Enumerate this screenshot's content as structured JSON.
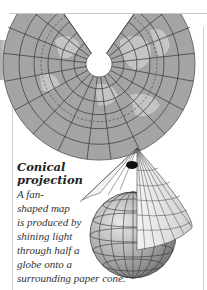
{
  "caption": {
    "title_lines": [
      "Conical",
      "projection"
    ],
    "body_lines": [
      "A fan-",
      "shaped map",
      "is produced by",
      "shining light",
      "through half a",
      "globe onto a",
      "surrounding paper cone."
    ]
  },
  "illustrations": {
    "fan_map": "conical-projection-fan-map",
    "globe_with_cone": "globe-inside-paper-cone"
  },
  "colors": {
    "map_land": "#b8b8b8",
    "map_sea": "#9a9a9a",
    "grid": "#3a3a3a",
    "frame": "#c8c8c8",
    "text": "#333333"
  }
}
